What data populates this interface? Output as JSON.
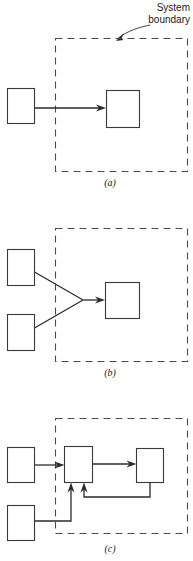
{
  "figure": {
    "width": 193,
    "height": 561,
    "background": "#ffffff",
    "line_color": "#2b2b2b",
    "boundary_color": "#4a4a4a",
    "box_stroke": "#3a3a3a"
  },
  "annotation": {
    "line1": "System",
    "line2": "boundary",
    "pointer": "curved-arrow-to-boundary"
  },
  "panels": [
    {
      "caption": "(a)",
      "description": "one external box feeding one box inside the system boundary",
      "boxes_outside": 1,
      "boxes_inside": 1,
      "arrows": 1
    },
    {
      "caption": "(b)",
      "description": "two external boxes converging into one box inside the system boundary",
      "boxes_outside": 2,
      "boxes_inside": 1,
      "arrows": 1
    },
    {
      "caption": "(c)",
      "description": "two external boxes feeding two boxes inside the boundary with a feedback loop",
      "boxes_outside": 2,
      "boxes_inside": 2,
      "arrows": 4
    }
  ]
}
